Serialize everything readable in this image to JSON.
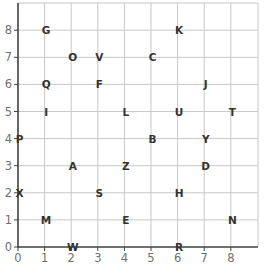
{
  "chart_data": {
    "type": "scatter",
    "title": "",
    "xlabel": "",
    "ylabel": "",
    "xlim": [
      0,
      9
    ],
    "ylim": [
      0,
      9
    ],
    "grid": true,
    "x_ticks": [
      0,
      1,
      2,
      3,
      4,
      5,
      6,
      7,
      8
    ],
    "y_ticks": [
      0,
      1,
      2,
      3,
      4,
      5,
      6,
      7,
      8
    ],
    "points": [
      {
        "label": "G",
        "x": 1,
        "y": 8
      },
      {
        "label": "K",
        "x": 6,
        "y": 8
      },
      {
        "label": "O",
        "x": 2,
        "y": 7
      },
      {
        "label": "V",
        "x": 3,
        "y": 7
      },
      {
        "label": "C",
        "x": 5,
        "y": 7
      },
      {
        "label": "Q",
        "x": 1,
        "y": 6
      },
      {
        "label": "F",
        "x": 3,
        "y": 6
      },
      {
        "label": "J",
        "x": 7,
        "y": 6
      },
      {
        "label": "I",
        "x": 1,
        "y": 5
      },
      {
        "label": "L",
        "x": 4,
        "y": 5
      },
      {
        "label": "U",
        "x": 6,
        "y": 5
      },
      {
        "label": "T",
        "x": 8,
        "y": 5
      },
      {
        "label": "P",
        "x": 0,
        "y": 4
      },
      {
        "label": "B",
        "x": 5,
        "y": 4
      },
      {
        "label": "Y",
        "x": 7,
        "y": 4
      },
      {
        "label": "A",
        "x": 2,
        "y": 3
      },
      {
        "label": "Z",
        "x": 4,
        "y": 3
      },
      {
        "label": "D",
        "x": 7,
        "y": 3
      },
      {
        "label": "X",
        "x": 0,
        "y": 2
      },
      {
        "label": "S",
        "x": 3,
        "y": 2
      },
      {
        "label": "H",
        "x": 6,
        "y": 2
      },
      {
        "label": "M",
        "x": 1,
        "y": 1
      },
      {
        "label": "E",
        "x": 4,
        "y": 1
      },
      {
        "label": "N",
        "x": 8,
        "y": 1
      },
      {
        "label": "W",
        "x": 2,
        "y": 0
      },
      {
        "label": "R",
        "x": 6,
        "y": 0
      }
    ]
  },
  "colors": {
    "grid": "#c8c8c8",
    "axis": "#404040",
    "tick_label": "#707070",
    "point_label": "#333333"
  }
}
